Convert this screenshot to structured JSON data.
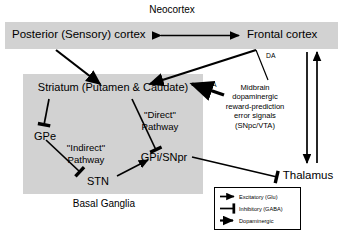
{
  "diagram": {
    "title": "Neocortex",
    "regions": {
      "neocortex_label": "Neocortex",
      "basal_ganglia_label": "Basal Ganglia"
    },
    "nodes": {
      "posterior_cortex": "Posterior (Sensory) cortex",
      "frontal_cortex": "Frontal cortex",
      "striatum": "Striatum (Putamen & Caudate)",
      "gpe": "GPe",
      "stn": "STN",
      "gpi_snpr": "GPi/SNpr",
      "thalamus": "Thalamus",
      "midbrain_line1": "Midbrain",
      "midbrain_line2": "dopaminergic",
      "midbrain_line3": "reward-prediction",
      "midbrain_line4": "error signals",
      "midbrain_line5": "(SNpc/VTA)"
    },
    "pathway_labels": {
      "direct_line1": "\"Direct\"",
      "direct_line2": "Pathway",
      "indirect_line1": "\"Indirect\"",
      "indirect_line2": "Pathway",
      "da_striatum": "DA",
      "da_frontal": "DA"
    },
    "legend": {
      "items": [
        {
          "glyph": "arrow-excitatory-icon",
          "label": "Excitatory (Glu)"
        },
        {
          "glyph": "bar-inhibitory-icon",
          "label": "Inhibitory (GABA)"
        },
        {
          "glyph": "arrow-dopaminergic-icon",
          "label": "Dopaminergic"
        }
      ]
    },
    "colors": {
      "shade": "#d2d2d2",
      "stroke": "#000000",
      "background": "#ffffff"
    }
  }
}
